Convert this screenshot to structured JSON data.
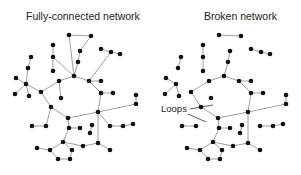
{
  "titles": {
    "left": "Fully-connected network",
    "right": "Broken network"
  },
  "annotation": {
    "label": "Loops"
  },
  "colors": {
    "node": "#111111",
    "edge": "#888888",
    "text": "#222222",
    "background": "#ffffff"
  },
  "left_network": {
    "nodes": {
      "A": [
        69,
        35
      ],
      "B": [
        91,
        36
      ],
      "C": [
        53,
        45
      ],
      "D": [
        53,
        57
      ],
      "E": [
        53,
        71
      ],
      "F": [
        80,
        51
      ],
      "G": [
        78,
        62
      ],
      "H": [
        101,
        49
      ],
      "I": [
        111,
        52
      ],
      "J": [
        120,
        54
      ],
      "K": [
        31,
        57
      ],
      "L": [
        28,
        68
      ],
      "M": [
        16,
        78
      ],
      "N": [
        26,
        84
      ],
      "O": [
        15,
        94
      ],
      "P": [
        29,
        96
      ],
      "Q": [
        41,
        92
      ],
      "R": [
        74,
        76
      ],
      "S": [
        59,
        81
      ],
      "T": [
        61,
        98
      ],
      "U": [
        89,
        81
      ],
      "V": [
        101,
        81
      ],
      "W": [
        101,
        93
      ],
      "X": [
        113,
        93
      ],
      "Y": [
        51,
        107
      ],
      "Z": [
        136,
        95
      ],
      "Z2": [
        136,
        104
      ],
      "AA": [
        68,
        118
      ],
      "AB": [
        69,
        128
      ],
      "AC": [
        80,
        128
      ],
      "AD": [
        98,
        112
      ],
      "AE": [
        92,
        125
      ],
      "AF": [
        90,
        133
      ],
      "AG": [
        32,
        126
      ],
      "AH": [
        46,
        126
      ],
      "AI": [
        110,
        126
      ],
      "AJ": [
        123,
        126
      ],
      "AK": [
        133,
        124
      ],
      "AL": [
        63,
        142
      ],
      "AM": [
        37,
        148
      ],
      "AN": [
        50,
        150
      ],
      "AO": [
        72,
        150
      ],
      "AP": [
        83,
        146
      ],
      "AQ": [
        98,
        143
      ],
      "AR": [
        110,
        150
      ],
      "AS": [
        58,
        159
      ],
      "AT": [
        70,
        159
      ]
    },
    "edges": [
      [
        "A",
        "B"
      ],
      [
        "B",
        "F"
      ],
      [
        "F",
        "G"
      ],
      [
        "G",
        "R"
      ],
      [
        "A",
        "R"
      ],
      [
        "C",
        "D"
      ],
      [
        "D",
        "E"
      ],
      [
        "D",
        "R"
      ],
      [
        "H",
        "I"
      ],
      [
        "I",
        "J"
      ],
      [
        "I",
        "U"
      ],
      [
        "K",
        "L"
      ],
      [
        "L",
        "N"
      ],
      [
        "M",
        "N"
      ],
      [
        "N",
        "O"
      ],
      [
        "N",
        "P"
      ],
      [
        "N",
        "Q"
      ],
      [
        "Q",
        "S"
      ],
      [
        "S",
        "R"
      ],
      [
        "S",
        "T"
      ],
      [
        "Q",
        "Y"
      ],
      [
        "R",
        "U"
      ],
      [
        "U",
        "V"
      ],
      [
        "U",
        "W"
      ],
      [
        "W",
        "X"
      ],
      [
        "W",
        "AD"
      ],
      [
        "Z",
        "Z2"
      ],
      [
        "Z2",
        "AD"
      ],
      [
        "Y",
        "AA"
      ],
      [
        "AA",
        "AD"
      ],
      [
        "AA",
        "AB"
      ],
      [
        "AB",
        "AC"
      ],
      [
        "AB",
        "AL"
      ],
      [
        "AD",
        "AI"
      ],
      [
        "AI",
        "AJ"
      ],
      [
        "AJ",
        "AK"
      ],
      [
        "AD",
        "AQ"
      ],
      [
        "AQ",
        "AR"
      ],
      [
        "AQ",
        "AP"
      ],
      [
        "AP",
        "AL"
      ],
      [
        "AL",
        "AO"
      ],
      [
        "AL",
        "AN"
      ],
      [
        "AN",
        "AM"
      ],
      [
        "AN",
        "AS"
      ],
      [
        "AS",
        "AT"
      ],
      [
        "AT",
        "AO"
      ],
      [
        "AG",
        "AH"
      ],
      [
        "AH",
        "Y"
      ],
      [
        "AE",
        "AF"
      ]
    ]
  },
  "right_network": {
    "offset_x": 150,
    "removed_edges": [
      [
        "A",
        "R"
      ],
      [
        "D",
        "R"
      ],
      [
        "I",
        "U"
      ],
      [
        "B",
        "F"
      ],
      [
        "AD",
        "AI"
      ],
      [
        "N",
        "Q"
      ],
      [
        "S",
        "T"
      ],
      [
        "L",
        "N"
      ],
      [
        "AH",
        "Y"
      ]
    ]
  },
  "loops_pointers": [
    [
      190,
      109,
      213,
      105
    ],
    [
      188,
      114,
      206,
      122
    ]
  ]
}
